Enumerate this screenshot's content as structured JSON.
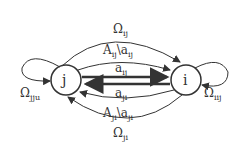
{
  "nodes": {
    "j": "j",
    "i": "i"
  },
  "labels": {
    "omega_ij": {
      "main": "Ω",
      "sub": "ij"
    },
    "A_ij": {
      "main": "A",
      "sub": "ij",
      "rest": "\\a",
      "sub2": "ij"
    },
    "a_ij": {
      "main": "a",
      "sub": "ij"
    },
    "a_ji": {
      "main": "a",
      "sub": "ji"
    },
    "A_ji": {
      "main": "A",
      "sub": "ji",
      "rest": "\\a",
      "sub2": "ji"
    },
    "omega_ji": {
      "main": "Ω",
      "sub": "ji"
    },
    "omega_jju": {
      "main": "Ω",
      "sub": "jju"
    },
    "omega_iij": {
      "main": "Ω",
      "sub": "iij"
    }
  }
}
